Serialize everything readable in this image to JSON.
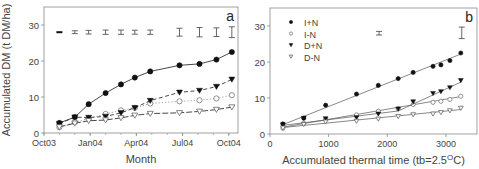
{
  "chart_data": [
    {
      "panel_label": "a",
      "type": "line",
      "title": "",
      "xlabel": "Month",
      "ylabel": "Accumulated DM (t DM/ha)",
      "x_unit": "months since Oct03",
      "xlim": [
        0,
        12.6
      ],
      "ylim": [
        0,
        35
      ],
      "xticks": [
        {
          "pos": 0,
          "label": "Oct03"
        },
        {
          "pos": 3,
          "label": "Jan04"
        },
        {
          "pos": 6,
          "label": "Apr04"
        },
        {
          "pos": 9,
          "label": "Jul04"
        },
        {
          "pos": 12,
          "label": "Oct04"
        }
      ],
      "xminor_step": 1,
      "yticks": [
        0,
        10,
        20,
        30
      ],
      "grid": false,
      "x": [
        1.0,
        2.0,
        2.9,
        4.0,
        5.0,
        5.9,
        6.9,
        8.8,
        10.1,
        11.2,
        12.2
      ],
      "series": [
        {
          "name": "I+N",
          "marker": "filled-circle",
          "line": "solid",
          "values": [
            2.8,
            4.4,
            8.0,
            11.1,
            13.5,
            15.4,
            17.1,
            18.8,
            19.2,
            20.4,
            22.5
          ]
        },
        {
          "name": "I-N",
          "marker": "open-circle",
          "line": "dotted",
          "values": [
            1.6,
            3.0,
            4.0,
            5.3,
            6.3,
            7.0,
            8.2,
            8.8,
            9.1,
            9.6,
            10.5
          ]
        },
        {
          "name": "D+N",
          "marker": "filled-triangle",
          "line": "dashed",
          "values": [
            2.6,
            4.4,
            4.3,
            4.6,
            5.6,
            7.0,
            9.0,
            11.3,
            11.8,
            12.9,
            14.9
          ]
        },
        {
          "name": "D-N",
          "marker": "open-triangle",
          "line": "dashdot",
          "values": [
            1.7,
            2.7,
            3.4,
            3.6,
            4.2,
            4.9,
            5.4,
            5.6,
            6.0,
            6.5,
            7.2
          ]
        }
      ],
      "error_bars": {
        "y_center": 28,
        "x": [
          1.0,
          2.0,
          2.9,
          4.0,
          5.0,
          5.9,
          6.9,
          8.8,
          10.1,
          11.2,
          12.2
        ],
        "half_width": [
          0.15,
          0.4,
          0.5,
          0.6,
          0.6,
          0.55,
          0.6,
          1.1,
          1.3,
          1.2,
          1.5
        ]
      }
    },
    {
      "panel_label": "b",
      "type": "scatter",
      "title": "",
      "xlabel": "Accumulated thermal time (tb=2.5°C)",
      "xlabel_parts": {
        "pre": "Accumulated thermal time (tb=2.5",
        "sup": "O",
        "post": "C)"
      },
      "ylabel": "",
      "xlim": [
        0,
        3530
      ],
      "ylim": [
        0,
        35
      ],
      "xticks": [
        {
          "pos": 0,
          "label": "0"
        },
        {
          "pos": 1000,
          "label": "1000"
        },
        {
          "pos": 2000,
          "label": "2000"
        },
        {
          "pos": 3000,
          "label": "3000"
        }
      ],
      "yticks": [
        0,
        10,
        20,
        30
      ],
      "grid": false,
      "legend": {
        "position": "upper-left",
        "entries": [
          "I+N",
          "I-N",
          "D+N",
          "D-N"
        ]
      },
      "x": [
        220,
        576,
        949,
        1475,
        1847,
        2186,
        2441,
        2780,
        2915,
        3068,
        3254
      ],
      "series": [
        {
          "name": "I+N",
          "marker": "filled-circle",
          "values": [
            2.8,
            4.4,
            8.0,
            11.1,
            13.5,
            15.4,
            17.1,
            18.8,
            19.2,
            20.4,
            22.5
          ],
          "fit": [
            [
              220,
              2.6
            ],
            [
              3254,
              22.2
            ]
          ]
        },
        {
          "name": "I-N",
          "marker": "open-circle",
          "values": [
            1.6,
            3.0,
            4.0,
            5.3,
            6.3,
            7.0,
            8.2,
            8.8,
            9.1,
            9.6,
            10.5
          ],
          "fit": [
            [
              220,
              1.9
            ],
            [
              3254,
              10.4
            ]
          ]
        },
        {
          "name": "D+N",
          "marker": "filled-triangle",
          "values": [
            2.6,
            4.4,
            4.3,
            4.6,
            5.6,
            7.0,
            9.0,
            11.3,
            11.8,
            12.9,
            14.9
          ],
          "fit": [
            [
              220,
              2.4
            ],
            [
              2186,
              6.4
            ],
            [
              3254,
              14.4
            ]
          ]
        },
        {
          "name": "D-N",
          "marker": "open-triangle",
          "values": [
            1.7,
            2.7,
            3.4,
            3.6,
            4.2,
            4.9,
            5.4,
            5.6,
            6.0,
            6.5,
            7.2
          ],
          "fit": [
            [
              220,
              1.8
            ],
            [
              3254,
              6.8
            ]
          ]
        }
      ],
      "error_bars": {
        "x": [
          1860,
          3270
        ],
        "y_center": [
          28,
          28.1
        ],
        "half_width": [
          0.5,
          1.6
        ]
      }
    }
  ]
}
